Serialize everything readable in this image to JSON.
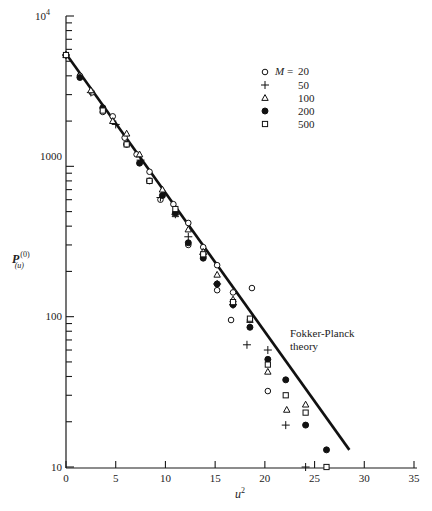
{
  "chart_data": {
    "type": "scatter",
    "title": "",
    "xlabel": "u²",
    "ylabel": "P(u)(0)",
    "xlim": [
      0,
      35
    ],
    "ylim": [
      10,
      10000
    ],
    "yscale": "log",
    "grid": false,
    "legend_position": "upper right",
    "legend_title": "M =",
    "x_ticks": [
      0,
      5,
      10,
      15,
      20,
      25,
      30,
      35
    ],
    "y_ticks": [
      10,
      100,
      1000,
      10000
    ],
    "y_tick_labels": [
      "10",
      "100",
      "1000",
      "10⁴"
    ],
    "annotations": [
      {
        "text": "Fokker-Planck theory",
        "x": 20,
        "y": 100
      }
    ],
    "theory_line": {
      "name": "Fokker-Planck theory",
      "x": [
        0,
        28.5
      ],
      "y": [
        5600,
        13
      ]
    },
    "series": [
      {
        "name": "20",
        "marker": "open-circle",
        "points": [
          [
            0,
            5500
          ],
          [
            1.4,
            4000
          ],
          [
            2.6,
            3100
          ],
          [
            3.7,
            2300
          ],
          [
            4.7,
            2150
          ],
          [
            5.9,
            1550
          ],
          [
            7.1,
            1200
          ],
          [
            8.4,
            920
          ],
          [
            9.5,
            600
          ],
          [
            10.8,
            560
          ],
          [
            12.3,
            300
          ],
          [
            12.3,
            420
          ],
          [
            13.8,
            290
          ],
          [
            13.8,
            250
          ],
          [
            15.2,
            220
          ],
          [
            15.2,
            150
          ],
          [
            16.8,
            145
          ],
          [
            16.6,
            95
          ],
          [
            18.7,
            155
          ],
          [
            18.5,
            95
          ],
          [
            20.3,
            32
          ]
        ]
      },
      {
        "name": "50",
        "marker": "plus",
        "points": [
          [
            0,
            5500
          ],
          [
            2.5,
            3100
          ],
          [
            5,
            1900
          ],
          [
            7.5,
            1100
          ],
          [
            9.5,
            620
          ],
          [
            11,
            480
          ],
          [
            12.3,
            340
          ],
          [
            13.8,
            260
          ],
          [
            15.2,
            165
          ],
          [
            16.8,
            120
          ],
          [
            18.2,
            65
          ],
          [
            20.3,
            60
          ],
          [
            22.1,
            19
          ],
          [
            24.1,
            10
          ]
        ]
      },
      {
        "name": "100",
        "marker": "open-triangle",
        "points": [
          [
            0,
            5500
          ],
          [
            2.5,
            3200
          ],
          [
            4.7,
            2000
          ],
          [
            6.1,
            1650
          ],
          [
            7.4,
            1200
          ],
          [
            9.7,
            700
          ],
          [
            11,
            480
          ],
          [
            12.3,
            380
          ],
          [
            13.8,
            270
          ],
          [
            15.2,
            190
          ],
          [
            16.8,
            130
          ],
          [
            18.5,
            95
          ],
          [
            20.3,
            43
          ],
          [
            22.2,
            24
          ],
          [
            24.1,
            26
          ]
        ]
      },
      {
        "name": "200",
        "marker": "filled-circle",
        "points": [
          [
            0,
            5500
          ],
          [
            1.4,
            3900
          ],
          [
            3.7,
            2450
          ],
          [
            6.1,
            1400
          ],
          [
            7.4,
            1050
          ],
          [
            8.4,
            800
          ],
          [
            9.7,
            640
          ],
          [
            11,
            490
          ],
          [
            12.3,
            310
          ],
          [
            13.8,
            245
          ],
          [
            15.2,
            165
          ],
          [
            16.8,
            120
          ],
          [
            18.5,
            85
          ],
          [
            20.3,
            52
          ],
          [
            22.1,
            38
          ],
          [
            24.1,
            19
          ],
          [
            26.2,
            13
          ]
        ]
      },
      {
        "name": "500",
        "marker": "open-square",
        "points": [
          [
            0,
            5500
          ],
          [
            3.7,
            2350
          ],
          [
            6.1,
            1400
          ],
          [
            8.4,
            800
          ],
          [
            11,
            520
          ],
          [
            13.8,
            260
          ],
          [
            16.8,
            125
          ],
          [
            18.5,
            97
          ],
          [
            20.3,
            48
          ],
          [
            22.1,
            30
          ],
          [
            24.1,
            23
          ],
          [
            26.2,
            10
          ]
        ]
      }
    ]
  },
  "axes": {
    "x_title": "u",
    "x_title_sup": "2",
    "y_title_main": "P",
    "y_title_sup": "(0)",
    "y_title_sub": "(u)",
    "y_top_label_base": "10",
    "y_top_label_exp": "4"
  },
  "legend": {
    "variable": "M",
    "equals": "=",
    "entries": [
      {
        "label": "20",
        "marker": "open-circle"
      },
      {
        "label": "50",
        "marker": "plus"
      },
      {
        "label": "100",
        "marker": "open-triangle"
      },
      {
        "label": "200",
        "marker": "filled-circle"
      },
      {
        "label": "500",
        "marker": "open-square"
      }
    ]
  },
  "annotation": {
    "line1": "Fokker-Planck",
    "line2": "theory"
  },
  "colors": {
    "ink": "#1a1a1a",
    "background": "#ffffff"
  }
}
